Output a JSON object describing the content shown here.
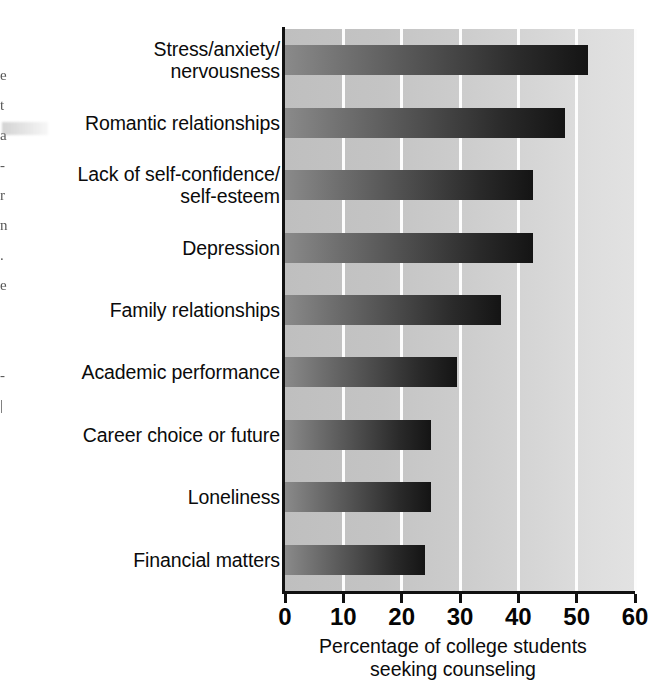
{
  "chart_data": {
    "type": "bar",
    "orientation": "horizontal",
    "title": "",
    "subtitle": "",
    "xlabel": "Percentage of college students\nseeking counseling",
    "ylabel": "",
    "xlim": [
      0,
      60
    ],
    "xticks": [
      0,
      10,
      20,
      30,
      40,
      50,
      60
    ],
    "xtick_labels": [
      "0",
      "10",
      "20",
      "30",
      "40",
      "50",
      "60"
    ],
    "grid": "vertical-white-gridlines",
    "legend": "none",
    "categories": [
      "Stress/anxiety/\nnervousness",
      "Romantic relationships",
      "Lack of self-confidence/\nself-esteem",
      "Depression",
      "Family relationships",
      "Academic performance",
      "Career choice or future",
      "Loneliness",
      "Financial matters"
    ],
    "values": [
      52,
      48,
      42.5,
      42.5,
      37,
      29.5,
      25,
      25,
      24
    ],
    "bar_fill": "gradient medium-gray to near-black, left to right",
    "plot_background": "#cccccc"
  },
  "axis": {
    "x_tick_labels": [
      "0",
      "10",
      "20",
      "30",
      "40",
      "50",
      "60"
    ],
    "x_title_line1": "Percentage of college students",
    "x_title_line2": "seeking counseling",
    "x_title": "Percentage of college students\nseeking counseling"
  },
  "bars": [
    {
      "label": "Stress/anxiety/\nnervousness",
      "value": 52
    },
    {
      "label": "Romantic relationships",
      "value": 48
    },
    {
      "label": "Lack of self-confidence/\nself-esteem",
      "value": 42.5
    },
    {
      "label": "Depression",
      "value": 42.5
    },
    {
      "label": "Family relationships",
      "value": 37
    },
    {
      "label": "Academic performance",
      "value": 29.5
    },
    {
      "label": "Career choice or future",
      "value": 25
    },
    {
      "label": "Loneliness",
      "value": 25
    },
    {
      "label": "Financial matters",
      "value": 24
    }
  ],
  "page_margin": {
    "fragment_text": "e\nt\na\n-\nr\nn\n.\ne\n\n\n-\n|",
    "note": "partial serif letters from adjacent printed column"
  },
  "colors": {
    "plot_background": "#cccccc",
    "gridline": "#fdfdfd",
    "bar_start": "#8a8a8a",
    "bar_end": "#141414",
    "axis": "#111111",
    "text": "#0b0b0b",
    "page_background": "#ffffff"
  }
}
